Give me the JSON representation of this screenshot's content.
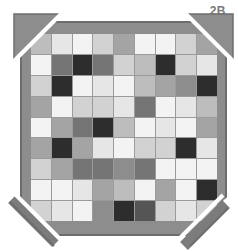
{
  "figure_label": "2B",
  "colors": {
    "page_bg": "#ffffff",
    "border": "#8d8d8d",
    "border_edge": "#6d6d6d",
    "grid_line": "#9b9b9b",
    "corner_band": "#7c7c7c",
    "corner_line": "#ffffff",
    "label_text": "#7a7a7a"
  },
  "palette": {
    "w": "#f3f3f3",
    "vl": "#e6e6e6",
    "l": "#d2d2d2",
    "ml": "#bdbdbd",
    "m": "#a4a4a4",
    "md": "#8d8d8d",
    "d": "#757575",
    "vd": "#555555",
    "k": "#2d2d2d"
  },
  "grid": {
    "rows": 9,
    "cols": 9,
    "cells": [
      [
        "ml",
        "vl",
        "w",
        "l",
        "m",
        "w",
        "w",
        "l",
        "m"
      ],
      [
        "w",
        "d",
        "k",
        "d",
        "l",
        "ml",
        "k",
        "l",
        "vl"
      ],
      [
        "l",
        "k",
        "w",
        "vl",
        "w",
        "ml",
        "m",
        "md",
        "k"
      ],
      [
        "m",
        "w",
        "l",
        "l",
        "vl",
        "d",
        "w",
        "vl",
        "ml"
      ],
      [
        "w",
        "m",
        "d",
        "k",
        "ml",
        "w",
        "vl",
        "w",
        "m"
      ],
      [
        "m",
        "k",
        "m",
        "vl",
        "w",
        "l",
        "l",
        "k",
        "vl"
      ],
      [
        "l",
        "m",
        "d",
        "d",
        "md",
        "d",
        "w",
        "w",
        "w"
      ],
      [
        "w",
        "w",
        "vl",
        "m",
        "ml",
        "w",
        "m",
        "w",
        "k"
      ],
      [
        "l",
        "vl",
        "w",
        "md",
        "k",
        "vd",
        "l",
        "vl",
        "l"
      ]
    ]
  }
}
